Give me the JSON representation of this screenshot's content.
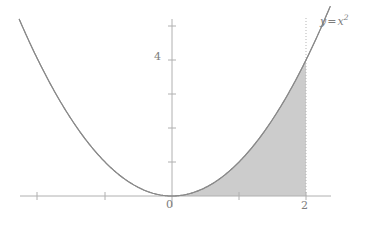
{
  "chart_data": {
    "type": "line",
    "title": "",
    "subtitle": "",
    "xlabel": "",
    "ylabel": "",
    "function": "y = x^2",
    "curve_label": "y = x²",
    "curve_label_parts": {
      "y": "y",
      "equals": "=",
      "x": "x",
      "exponent": "2"
    },
    "xlim": [
      -2.28,
      2.36
    ],
    "ylim": [
      -0.85,
      5.25
    ],
    "grid": false,
    "legend": false,
    "x_ticks": [
      -2,
      -1,
      1,
      2
    ],
    "x_tick_labels": [
      "",
      "",
      "",
      "2"
    ],
    "y_ticks": [
      1,
      2,
      3,
      4,
      5
    ],
    "y_tick_labels": [
      "",
      "",
      "",
      "4",
      ""
    ],
    "origin_label": "0",
    "series": [
      {
        "name": "y = x^2",
        "x": [
          -2.28,
          -2.1,
          -1.9,
          -1.7,
          -1.5,
          -1.3,
          -1.1,
          -0.9,
          -0.7,
          -0.5,
          -0.3,
          -0.1,
          0,
          0.1,
          0.3,
          0.5,
          0.7,
          0.9,
          1.1,
          1.3,
          1.5,
          1.7,
          1.9,
          2.0,
          2.1,
          2.2,
          2.3,
          2.36
        ],
        "y": [
          5.198,
          4.41,
          3.61,
          2.89,
          2.25,
          1.69,
          1.21,
          0.81,
          0.49,
          0.25,
          0.09,
          0.01,
          0,
          0.01,
          0.09,
          0.25,
          0.49,
          0.81,
          1.21,
          1.69,
          2.25,
          2.89,
          3.61,
          4.0,
          4.41,
          4.84,
          5.29,
          5.57
        ]
      }
    ],
    "shaded_region": {
      "label": "area under curve",
      "x_from": 0,
      "x_to": 2,
      "y_from": 0,
      "fill_color": "#cccccc"
    },
    "annotations": [
      {
        "name": "dotted-line-x2",
        "type": "vertical-dotted-line",
        "x": 2,
        "y_from": 0,
        "y_to": 5.25,
        "color": "#b5b5b5"
      }
    ],
    "colors": {
      "curve": "#8a8a8a",
      "axis": "#b0b0b0",
      "tick": "#b0b0b0",
      "text": "#7d7d7d",
      "fill": "#cccccc",
      "background": "#ffffff"
    }
  }
}
